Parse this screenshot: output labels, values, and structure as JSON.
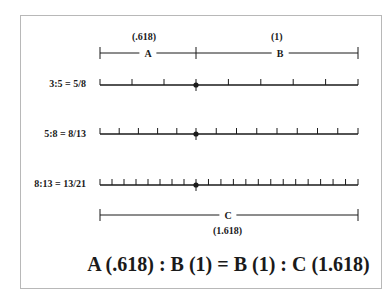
{
  "segments": {
    "a": {
      "letter": "A",
      "value": "(.618)"
    },
    "b": {
      "letter": "B",
      "value": "(1)"
    },
    "c": {
      "letter": "C",
      "value": "(1.618)"
    }
  },
  "rows": [
    {
      "label": "3:5 = 5/8",
      "left_divisions": 3,
      "right_divisions": 5
    },
    {
      "label": "5:8 = 8/13",
      "left_divisions": 5,
      "right_divisions": 8
    },
    {
      "label": "8:13 = 13/21",
      "left_divisions": 8,
      "right_divisions": 13
    }
  ],
  "equation": "A (.618) : B (1) = B (1) : C (1.618)",
  "colors": {
    "line": "#1a1a1a",
    "frame": "#b8b8b8"
  }
}
